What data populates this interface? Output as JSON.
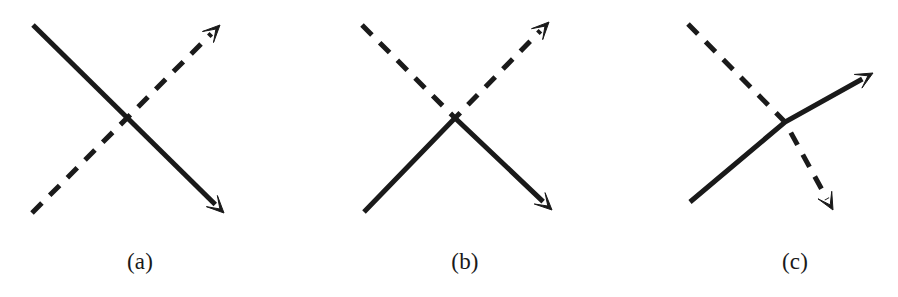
{
  "figure": {
    "type": "diagram",
    "title": "",
    "background_color": "#ffffff",
    "stroke_color": "#1a1a1a",
    "width": 898,
    "height": 297,
    "panel_count": 3
  },
  "panels": [
    {
      "id": "a",
      "label": "(a)",
      "label_x": 140,
      "label_y": 250,
      "crossing": {
        "x": 125,
        "y": 118
      },
      "lines": [
        {
          "name": "solid-line-a",
          "style": "solid",
          "stroke_width": 5,
          "from": {
            "x": 33,
            "y": 25
          },
          "to": {
            "x": 224,
            "y": 213
          },
          "arrowhead": "end",
          "arrow_size": 17
        },
        {
          "name": "dashed-line-a",
          "style": "dashed",
          "stroke_width": 5,
          "dash_pattern": "14 11",
          "from": {
            "x": 32,
            "y": 213
          },
          "to": {
            "x": 220,
            "y": 25
          },
          "arrowhead": "end",
          "arrow_size": 17
        }
      ]
    },
    {
      "id": "b",
      "label": "(b)",
      "label_x": 465,
      "label_y": 250,
      "crossing": {
        "x": 455,
        "y": 118
      },
      "lines": [
        {
          "name": "solid-line-b",
          "style": "solid",
          "stroke_width": 5,
          "from": {
            "x": 364,
            "y": 212
          },
          "to": {
            "x": 552,
            "y": 210
          },
          "via": {
            "x": 455,
            "y": 118
          },
          "arrowhead": "end",
          "arrow_size": 17
        },
        {
          "name": "dashed-line-b",
          "style": "dashed",
          "stroke_width": 5,
          "dash_pattern": "14 11",
          "from": {
            "x": 362,
            "y": 25
          },
          "to": {
            "x": 549,
            "y": 22
          },
          "via": {
            "x": 455,
            "y": 118
          },
          "arrowhead": "end",
          "arrow_size": 17
        }
      ]
    },
    {
      "id": "c",
      "label": "(c)",
      "label_x": 795,
      "label_y": 250,
      "crossing": {
        "x": 785,
        "y": 122
      },
      "lines": [
        {
          "name": "solid-line-c",
          "style": "solid",
          "stroke_width": 5,
          "from": {
            "x": 690,
            "y": 202
          },
          "to": {
            "x": 873,
            "y": 73
          },
          "via": {
            "x": 785,
            "y": 122
          },
          "arrowhead": "end",
          "arrow_size": 17
        },
        {
          "name": "dashed-line-c",
          "style": "dashed",
          "stroke_width": 5,
          "dash_pattern": "14 11",
          "from": {
            "x": 688,
            "y": 24
          },
          "to": {
            "x": 833,
            "y": 210
          },
          "via": {
            "x": 785,
            "y": 122
          },
          "arrowhead": "end",
          "arrow_size": 17
        }
      ]
    }
  ]
}
